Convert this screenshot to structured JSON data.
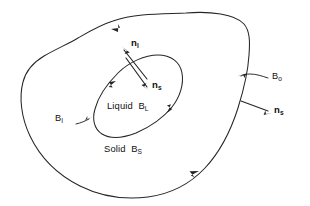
{
  "figure": {
    "background_color": "#ffffff",
    "line_color": "#262626",
    "text_color": "#111111",
    "width": 310,
    "height": 206
  },
  "labels": {
    "outer_boundary": {
      "base": "B",
      "sub": "o",
      "full": "Bo"
    },
    "interface_boundary": {
      "base": "B",
      "sub": "I",
      "full": "BI"
    },
    "liquid_region": {
      "text": "Liquid",
      "base": "B",
      "sub": "L",
      "full": "Liquid BL"
    },
    "solid_region": {
      "text": "Solid",
      "base": "B",
      "sub": "S",
      "full": "Solid BS"
    },
    "normal_liquid": {
      "base": "n",
      "sub": "l",
      "full": "nl"
    },
    "normal_solid_interface": {
      "base": "n",
      "sub": "s",
      "full": "ns"
    },
    "normal_solid_outer": {
      "base": "n",
      "sub": "s",
      "full": "ns"
    }
  },
  "annotations": {
    "outer_curve_orientation_arrows": 2,
    "inner_curve_orientation_arrows": 2,
    "leader_lines": 2,
    "normal_vectors": 3
  }
}
